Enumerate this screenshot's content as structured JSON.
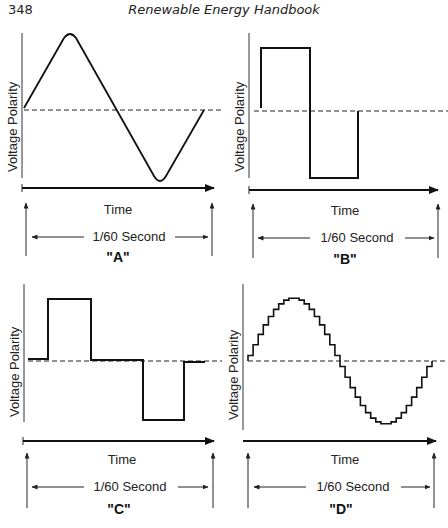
{
  "page": {
    "number": "348",
    "running_head": "Renewable Energy Handbook"
  },
  "figure": {
    "axis_y_label": "Voltage Polarity",
    "axis_x_label": "Time",
    "period_label": "1/60  Second",
    "panels": [
      {
        "id": "A",
        "caption": "\"A\"",
        "waveform": "sine"
      },
      {
        "id": "B",
        "caption": "\"B\"",
        "waveform": "square"
      },
      {
        "id": "C",
        "caption": "\"C\"",
        "waveform": "modified-square"
      },
      {
        "id": "D",
        "caption": "\"D\"",
        "waveform": "stepped-sine"
      }
    ]
  },
  "colors": {
    "ink": "#111111",
    "background": "#ffffff"
  }
}
